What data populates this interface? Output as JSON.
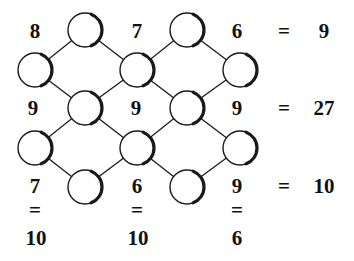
{
  "puzzle": {
    "colors": {
      "line": "#1a1a1a",
      "circle_fill": "#ffffff",
      "text": "#111111"
    },
    "circle_radius": 17,
    "circles": [
      {
        "id": "c1",
        "x": 85,
        "y": 30
      },
      {
        "id": "c2",
        "x": 187,
        "y": 30
      },
      {
        "id": "c3",
        "x": 35,
        "y": 70
      },
      {
        "id": "c4",
        "x": 137,
        "y": 70
      },
      {
        "id": "c5",
        "x": 240,
        "y": 70
      },
      {
        "id": "c6",
        "x": 85,
        "y": 108
      },
      {
        "id": "c7",
        "x": 187,
        "y": 108
      },
      {
        "id": "c8",
        "x": 35,
        "y": 148
      },
      {
        "id": "c9",
        "x": 137,
        "y": 148
      },
      {
        "id": "c10",
        "x": 240,
        "y": 148
      },
      {
        "id": "c11",
        "x": 85,
        "y": 187
      },
      {
        "id": "c12",
        "x": 187,
        "y": 187
      }
    ],
    "edges": [
      [
        "c1",
        "c3"
      ],
      [
        "c1",
        "c4"
      ],
      [
        "c2",
        "c4"
      ],
      [
        "c2",
        "c5"
      ],
      [
        "c3",
        "c6"
      ],
      [
        "c4",
        "c6"
      ],
      [
        "c4",
        "c7"
      ],
      [
        "c5",
        "c7"
      ],
      [
        "c6",
        "c8"
      ],
      [
        "c6",
        "c9"
      ],
      [
        "c7",
        "c9"
      ],
      [
        "c7",
        "c10"
      ],
      [
        "c8",
        "c11"
      ],
      [
        "c9",
        "c11"
      ],
      [
        "c9",
        "c12"
      ],
      [
        "c10",
        "c12"
      ]
    ],
    "cell_numbers": {
      "r1": [
        "8",
        "7",
        "6"
      ],
      "r2": [
        "9",
        "9",
        "9"
      ],
      "r3": [
        "7",
        "6",
        "9"
      ]
    },
    "row_results": {
      "eq": "=",
      "r1": "9",
      "r2": "27",
      "r3": "10"
    },
    "column_results": {
      "eq": "=",
      "c1": "10",
      "c2": "10",
      "c3": "6"
    }
  }
}
